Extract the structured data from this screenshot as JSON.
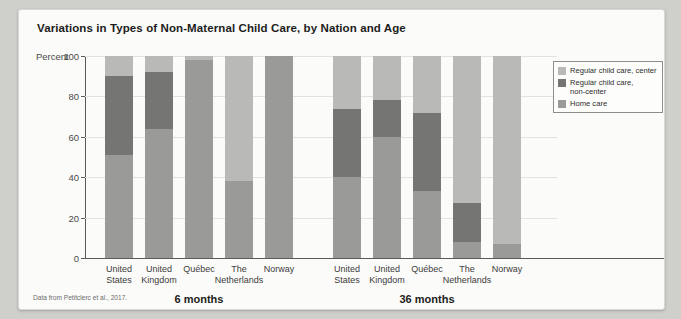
{
  "figure": {
    "title": "Variations in Types of Non-Maternal Child Care, by Nation and Age",
    "source": "Data from Petitclerc et al., 2017."
  },
  "axis": {
    "percent_label": "Percent",
    "yticks": [
      "0",
      "20",
      "40",
      "60",
      "80",
      "100"
    ]
  },
  "legend": {
    "items": [
      {
        "label": "Regular child care, center",
        "color": "#b9b9b7"
      },
      {
        "label": "Regular child care, non-center",
        "color": "#757574"
      },
      {
        "label": "Home care",
        "color": "#9a9a98"
      }
    ]
  },
  "groups": [
    {
      "label": "6 months"
    },
    {
      "label": "36 months"
    }
  ],
  "chart_data": {
    "type": "bar",
    "subtype": "stacked-bar",
    "title": "Variations in Types of Non-Maternal Child Care, by Nation and Age",
    "xlabel": "",
    "ylabel": "Percent",
    "ylim": [
      0,
      100
    ],
    "yticks": [
      0,
      20,
      40,
      60,
      80,
      100
    ],
    "grid": true,
    "legend_position": "right-inside",
    "stack_order_bottom_to_top": [
      "Home care",
      "Regular child care, non-center",
      "Regular child care, center"
    ],
    "groups": [
      "6 months",
      "36 months"
    ],
    "categories": [
      "United States",
      "United Kingdom",
      "Québec",
      "The Netherlands",
      "Norway"
    ],
    "series": [
      {
        "name": "Home care",
        "color": "#9a9a98",
        "values_6_months": [
          51,
          64,
          98,
          38,
          100
        ],
        "values_36_months": [
          40,
          60,
          33,
          8,
          7
        ]
      },
      {
        "name": "Regular child care, non-center",
        "color": "#757574",
        "values_6_months": [
          39,
          28,
          0,
          0,
          0
        ],
        "values_36_months": [
          34,
          18,
          39,
          19,
          0
        ]
      },
      {
        "name": "Regular child care, center",
        "color": "#b9b9b7",
        "values_6_months": [
          10,
          8,
          2,
          62,
          0
        ],
        "values_36_months": [
          26,
          22,
          28,
          73,
          93
        ]
      }
    ],
    "bars": [
      {
        "group": "6 months",
        "category": "United States",
        "home": 51,
        "noncenter": 39,
        "center": 10
      },
      {
        "group": "6 months",
        "category": "United Kingdom",
        "home": 64,
        "noncenter": 28,
        "center": 8
      },
      {
        "group": "6 months",
        "category": "Québec",
        "home": 98,
        "noncenter": 0,
        "center": 2
      },
      {
        "group": "6 months",
        "category": "The Netherlands",
        "home": 38,
        "noncenter": 0,
        "center": 62
      },
      {
        "group": "6 months",
        "category": "Norway",
        "home": 100,
        "noncenter": 0,
        "center": 0
      },
      {
        "group": "36 months",
        "category": "United States",
        "home": 40,
        "noncenter": 34,
        "center": 26
      },
      {
        "group": "36 months",
        "category": "United Kingdom",
        "home": 60,
        "noncenter": 18,
        "center": 22
      },
      {
        "group": "36 months",
        "category": "Québec",
        "home": 33,
        "noncenter": 39,
        "center": 28
      },
      {
        "group": "36 months",
        "category": "The Netherlands",
        "home": 8,
        "noncenter": 19,
        "center": 73
      },
      {
        "group": "36 months",
        "category": "Norway",
        "home": 7,
        "noncenter": 0,
        "center": 93
      }
    ]
  }
}
